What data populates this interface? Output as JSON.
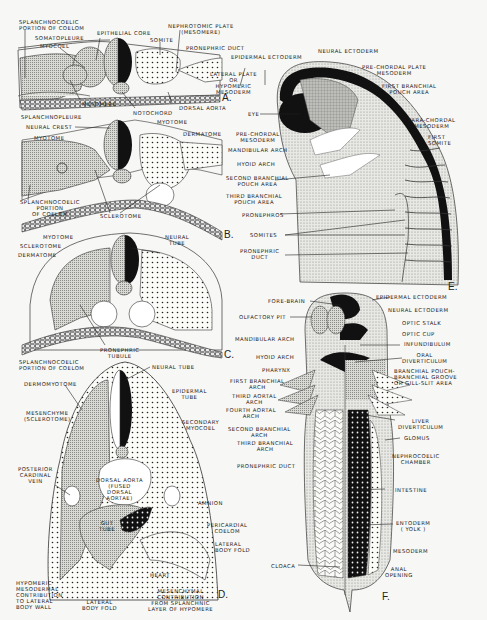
{
  "figure": {
    "panels": [
      "A.",
      "B.",
      "C.",
      "D.",
      "E.",
      "F."
    ]
  },
  "panelA": {
    "labels": {
      "splanchnocoelic": "SPLANCHNOCOELIC\nPORTION OF COELOM",
      "somatopleure": "SOMATOPLEURE",
      "myocoel": "MYOCOEL",
      "epithelial_core": "EPITHELIAL CORE",
      "nephrotomic": "NEPHROTOMIC PLATE\n(MESOMERE)",
      "somite": "SOMITE",
      "pronephric_duct": "PRONEPHRIC DUCT",
      "epidermal": "EPIDERMAL ECTODERM",
      "lateral_plate": "LATERAL PLATE\nOR\nHYPOMERIC\nMESODERM",
      "mesomere": "MESOMERE",
      "notochord": "NOTOCHORD",
      "dorsal_aorta": "DORSAL AORTA",
      "splanchnopleure": "SPLANCHNOPLEURE"
    }
  },
  "panelB": {
    "labels": {
      "neural_crest": "NEURAL CREST",
      "myotome_top": "MYOTOME",
      "myotome_left": "MYOTOME",
      "dermatome": "DERMATOME",
      "splanchnocoelic": "SPLANCHNOCOELIC\nPORTION\nOF COELOM",
      "sclerotome": "SCLEROTOME"
    }
  },
  "panelC": {
    "labels": {
      "myotome": "MYOTOME",
      "sclerotome": "SCLEROTOME",
      "dermatome": "DERMATOME",
      "neural_tube": "NEURAL\nTUBE",
      "pronephric_tubule": "PRONEPHRIC\nTUBULE",
      "splanchnocoelic": "SPLANCHNOCOELIC\nPORTION OF COELOM"
    }
  },
  "panelD": {
    "labels": {
      "neural_tube": "NEURAL TUBE",
      "dermomyotome": "DERMOMYOTOME",
      "epidermal_tube": "EPIDERMAL\nTUBE",
      "mesenchyme": "MESENCHYME\n(SCLEROTOME)",
      "secondary_myocoel": "SECONDARY\nMYOCOEL",
      "posterior_cardinal": "POSTERIOR\nCARDINAL\nVEIN",
      "dorsal_aorta": "DORSAL AORTA\n(FUSED\nDORSAL\nAORTAE)",
      "amnion": "AMNION",
      "gut_tube": "GUT\nTUBE",
      "pericardial": "PERICARDIAL\nCOELOM",
      "lateral_fold_r": "LATERAL\nBODY FOLD",
      "heart": "HEART",
      "hypomeric": "HYPOMERIC\nMESODERMAL\nCONTRIBUTION\nTO LATERAL\nBODY WALL",
      "lateral_fold_b": "LATERAL\nBODY FOLD",
      "mesenchymal": "MESENCHYMAL\nCONTRIBUTION\nFROM SPLANCHNIC\nLAYER OF HYPOMERE"
    }
  },
  "panelE": {
    "labels": {
      "epidermal": "EPIDERMAL ECTODERM",
      "neural": "NEURAL ECTODERM",
      "prechordal_plate": "PRE-CHORDAL PLATE\nMESODERM",
      "first_pouch": "FIRST BRANCHIAL\nPOUCH AREA",
      "eye": "EYE",
      "parachordal": "PARA-CHORDAL\nMESODERM",
      "first_somite": "FIRST\nSOMITE",
      "prechordal_meso": "PRE-CHORDAL\nMESODERM",
      "mandibular": "MANDIBULAR ARCH",
      "hyoid": "HYOID ARCH",
      "second_pouch": "SECOND BRANCHIAL\nPOUCH AREA",
      "third_pouch": "THIRD BRANCHIAL\nPOUCH AREA",
      "pronephros": "PRONEPHROS",
      "somites": "SOMITES",
      "pronephric_duct": "PRONEPHRIC\nDUCT"
    }
  },
  "panelF": {
    "labels": {
      "fore_brain": "FORE-BRAIN",
      "epidermal": "EPIDERMAL ECTODERM",
      "olfactory": "OLFACTORY PIT",
      "neural": "NEURAL ECTODERM",
      "optic_stalk": "OPTIC STALK",
      "optic_cup": "OPTIC CUP",
      "mandibular": "MANDIBULAR ARCH",
      "infundibulum": "INFUNDIBULUM",
      "hyoid": "HYOID ARCH",
      "oral": "ORAL\nDIVERTICULUM",
      "pharynx": "PHARYNX",
      "branchial_pouch": "BRANCHIAL POUCH-\nBRANCHIAL GROOVE\nOR GILL-SLIT AREA",
      "first_branchial": "FIRST BRANCHIAL\nARCH",
      "third_aortal": "THIRD AORTAL\nARCH",
      "fourth_aortal": "FOURTH AORTAL\nARCH",
      "liver": "LIVER\nDIVERTICULUM",
      "second_branchial": "SECOND BRANCHIAL\nARCH",
      "glomus": "GLOMUS",
      "third_branchial": "THIRD BRANCHIAL\nARCH",
      "nephrocoelic": "NEPHROCOELIC\nCHAMBER",
      "pronephric_duct": "PRONEPHRIC DUCT",
      "intestine": "INTESTINE",
      "entoderm": "ENTODERM\n( YOLK )",
      "mesoderm": "MESODERM",
      "cloaca": "CLOACA",
      "anal": "ANAL\nOPENING"
    }
  }
}
